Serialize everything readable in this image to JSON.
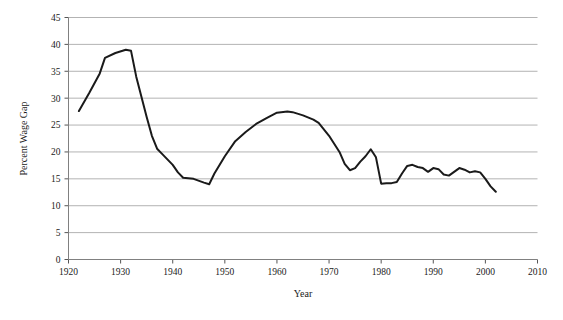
{
  "chart_data": {
    "type": "line",
    "title": "",
    "xlabel": "Year",
    "ylabel": "Percent Wage Gap",
    "xlim": [
      1920,
      2010
    ],
    "ylim": [
      0,
      45
    ],
    "xticks": [
      1920,
      1930,
      1940,
      1950,
      1960,
      1970,
      1980,
      1990,
      2000,
      2010
    ],
    "yticks": [
      0,
      5,
      10,
      15,
      20,
      25,
      30,
      35,
      40,
      45
    ],
    "grid": "horizontal",
    "legend": "none",
    "line_color": "#1a1a1a",
    "grid_color": "#b3b3b3",
    "axis_color": "#808080",
    "series": [
      {
        "name": "Percent Wage Gap",
        "x": [
          1922,
          1924,
          1926,
          1927,
          1929,
          1931,
          1932,
          1933,
          1935,
          1936,
          1937,
          1938,
          1940,
          1941,
          1942,
          1944,
          1946,
          1947,
          1948,
          1950,
          1952,
          1954,
          1956,
          1958,
          1960,
          1962,
          1963,
          1965,
          1967,
          1968,
          1970,
          1972,
          1973,
          1974,
          1975,
          1976,
          1977,
          1978,
          1979,
          1980,
          1981,
          1982,
          1983,
          1984,
          1985,
          1986,
          1987,
          1988,
          1989,
          1990,
          1991,
          1992,
          1993,
          1994,
          1995,
          1996,
          1997,
          1998,
          1999,
          2000,
          2001,
          2002
        ],
        "values": [
          27.6,
          31.0,
          34.6,
          37.5,
          38.4,
          39.0,
          38.8,
          34.0,
          26.5,
          23.0,
          20.6,
          19.6,
          17.6,
          16.2,
          15.2,
          15.0,
          14.3,
          14.0,
          16.0,
          19.2,
          22.0,
          23.7,
          25.2,
          26.3,
          27.3,
          27.5,
          27.4,
          26.8,
          26.0,
          25.4,
          23.0,
          20.0,
          17.8,
          16.6,
          17.0,
          18.2,
          19.2,
          20.5,
          19.0,
          14.1,
          14.2,
          14.2,
          14.4,
          16.0,
          17.4,
          17.6,
          17.2,
          17.0,
          16.3,
          17.0,
          16.8,
          15.8,
          15.6,
          16.3,
          17.0,
          16.7,
          16.2,
          16.4,
          16.2,
          15.0,
          13.6,
          12.6
        ]
      }
    ]
  }
}
